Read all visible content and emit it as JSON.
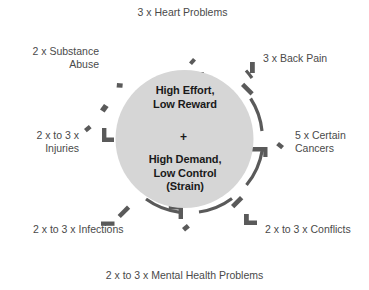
{
  "diagram": {
    "type": "radial-arrow-burst",
    "title_center": {
      "line1": "High Effort,\nLow Reward",
      "connector": "+",
      "line2": "High Demand,\nLow Control\n(Strain)"
    },
    "colors": {
      "background": "#ffffff",
      "circle_fill": "#d6d6d6",
      "arrow_fill": "#d2d2d2",
      "shadow": "#5a5a5a",
      "label_text": "#4a4a4a",
      "core_text": "#1a1a1a"
    },
    "outcomes": [
      {
        "id": "heart-problems",
        "direction": "n",
        "multiplier": "3 x",
        "name": "Heart Problems",
        "label": "3 x Heart Problems"
      },
      {
        "id": "back-pain",
        "direction": "ne",
        "multiplier": "3 x",
        "name": "Back Pain",
        "label": "3 x Back Pain"
      },
      {
        "id": "certain-cancers",
        "direction": "e",
        "multiplier": "5 x",
        "name": "Certain Cancers",
        "label": "5 x Certain\nCancers"
      },
      {
        "id": "conflicts",
        "direction": "se",
        "multiplier": "2 x to 3 x",
        "name": "Conflicts",
        "label": "2 x to 3 x Conflicts"
      },
      {
        "id": "mental-health-problems",
        "direction": "s",
        "multiplier": "2 x to 3 x",
        "name": "Mental Health Problems",
        "label": "2 x to 3 x Mental Health Problems"
      },
      {
        "id": "infections",
        "direction": "sw",
        "multiplier": "2 x to 3 x",
        "name": "Infections",
        "label": "2 x to 3 x Infections"
      },
      {
        "id": "injuries",
        "direction": "w",
        "multiplier": "2 x to 3 x",
        "name": "Injuries",
        "label": "2 x to 3 x\nInjuries"
      },
      {
        "id": "substance-abuse",
        "direction": "nw",
        "multiplier": "2 x",
        "name": "Substance Abuse",
        "label": "2 x Substance\nAbuse"
      }
    ]
  }
}
